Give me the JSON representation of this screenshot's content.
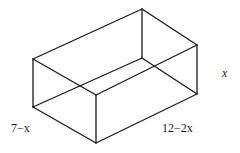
{
  "diagram": {
    "type": "rectangular-box-wireframe",
    "labels": {
      "height": "x",
      "depth": "7−x",
      "length": "12−2x"
    },
    "line_color": "#1a1a1a",
    "vertices": {
      "left_top": [
        33,
        59
      ],
      "left_bottom": [
        33,
        107
      ],
      "back_top": [
        142,
        9
      ],
      "back_bottom": [
        142,
        58
      ],
      "right_top": [
        197,
        45
      ],
      "right_bottom": [
        197,
        94
      ],
      "front_top": [
        96,
        95
      ],
      "front_bottom": [
        96,
        143
      ]
    }
  }
}
